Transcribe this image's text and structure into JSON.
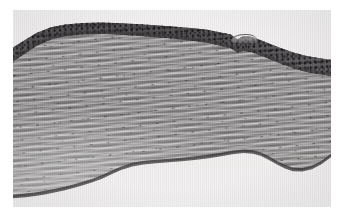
{
  "page": {
    "type": "photomicrograph-figure",
    "background_color": "#ffffff",
    "width_px": 342,
    "height_px": 223,
    "caption": "",
    "label": "",
    "scale_bar": "",
    "magnification": ""
  },
  "plate": {
    "name": "histology-micrograph",
    "left_px": 13,
    "top_px": 10,
    "width_px": 318,
    "height_px": 197,
    "stain": "hematoxylin-and-eosin",
    "rendering": "grayscale",
    "background_color": "#e9e8e7",
    "border": "none"
  },
  "specimen": {
    "description": "Transverse section of a thin, sheet-like collagenous tissue (cornea-like) running left-to-right across the field. A dark-staining stratified surface epithelium caps the upper border; beneath it a thick stroma of wavy, parallel collagen lamellae occupies most of the section; a thin dark posterior boundary line delimits the lower border, below which is empty mounting medium.",
    "orientation": "surface epithelium uppermost, posterior surface lowermost",
    "layers": [
      {
        "name": "surface-epithelium",
        "position": "upper border of section",
        "appearance": "dark band studded with small round hyperchromatic nuclei",
        "relative_thickness": "thin",
        "color": "#3a383a"
      },
      {
        "name": "basement-membrane",
        "position": "immediately beneath the epithelium",
        "appearance": "thin continuous darker line",
        "relative_thickness": "very thin",
        "color": "#3c3a3c"
      },
      {
        "name": "collagenous-stroma",
        "position": "bulk of the section",
        "appearance": "wavy parallel lamellae with elongated flattened keratocyte nuclei and pale interlamellar clefts",
        "relative_thickness": "thick",
        "color": "#8d8b8b"
      },
      {
        "name": "posterior-boundary",
        "position": "lower border of section",
        "appearance": "thin dark continuous line following an undulating, stepped contour",
        "relative_thickness": "very thin",
        "color": "#302e30"
      },
      {
        "name": "mounting-medium",
        "position": "above and below the section",
        "appearance": "empty pale field",
        "relative_thickness": "n/a",
        "color": "#e9e8e7"
      }
    ],
    "features": [
      {
        "name": "epithelial-notch",
        "location": "upper border, right of centre",
        "description": "step-like dip where the epithelium abruptly thins"
      },
      {
        "name": "surface-flap",
        "location": "upper border, right of centre",
        "description": "small detached fold of surface tissue lifted off the epithelium"
      },
      {
        "name": "posterior-notch",
        "location": "lower border, right of centre",
        "description": "V-shaped upward deflection of the posterior boundary"
      },
      {
        "name": "sectioning-fold",
        "location": "lower-left quadrant",
        "description": "lighter, looser area of stroma with wider interlamellar spaces"
      }
    ],
    "contour": {
      "upper_border": "rises steeply from the left edge, plateaus across the middle third, then slopes progressively downward toward the right edge",
      "lower_border": "runs near the lower third on the right, rises to a notch right of centre, then descends steadily to the lower-left corner"
    }
  }
}
